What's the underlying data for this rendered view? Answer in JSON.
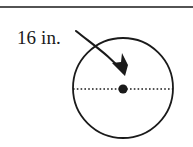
{
  "figure": {
    "kind": "geometry-diagram",
    "background_color": "#ffffff",
    "ink_color": "#1a1a1a",
    "top_rule": {
      "name": "horizontal-rule",
      "y": 7,
      "x_start": 0,
      "x_end": 193,
      "thickness": 1.6
    },
    "label": {
      "text": "16 in.",
      "value": "16",
      "unit": "in.",
      "x": 17,
      "y": 44,
      "font_size": 19
    },
    "arrow": {
      "name": "curved-arrow",
      "description": "curved arrow from the label to the center of the circle",
      "tail_x": 76,
      "tail_y": 31,
      "tip_x": 124,
      "tip_y": 74
    },
    "circle": {
      "name": "circle-outline",
      "center_x": 123,
      "center_y": 88,
      "radius": 50,
      "stroke_width": 1.8
    },
    "diameter_line": {
      "name": "dotted-diameter",
      "style": "dotted",
      "x_start": 73,
      "x_end": 173,
      "y": 89
    },
    "center_dot": {
      "name": "center-point-dot",
      "x": 123,
      "y": 89,
      "radius": 4.5
    }
  }
}
